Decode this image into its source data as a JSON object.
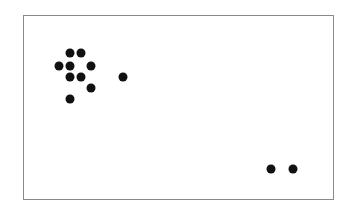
{
  "chart_data": {
    "type": "scatter",
    "title": "",
    "xlabel": "",
    "ylabel": "",
    "grid": false,
    "legend": null,
    "axis_ticks": "none",
    "frame": {
      "left": 23,
      "top": 15,
      "right": 333,
      "bottom": 199
    },
    "marker_color": "#111111",
    "points": [
      {
        "x": 70,
        "y": 53
      },
      {
        "x": 81,
        "y": 53
      },
      {
        "x": 59,
        "y": 66
      },
      {
        "x": 70,
        "y": 66
      },
      {
        "x": 91,
        "y": 66
      },
      {
        "x": 70,
        "y": 77
      },
      {
        "x": 81,
        "y": 77
      },
      {
        "x": 123,
        "y": 77
      },
      {
        "x": 91,
        "y": 88
      },
      {
        "x": 70,
        "y": 99
      },
      {
        "x": 271,
        "y": 169
      },
      {
        "x": 293,
        "y": 169
      }
    ]
  }
}
